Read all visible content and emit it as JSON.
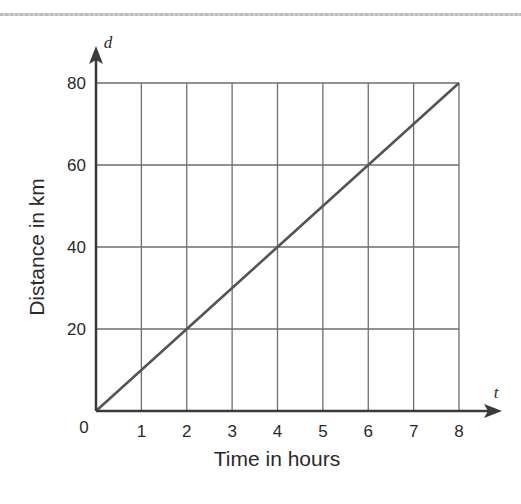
{
  "chart_data": {
    "type": "line",
    "title": "",
    "xlabel": "Time in hours",
    "ylabel": "Distance in km",
    "x_axis_variable": "t",
    "y_axis_variable": "d",
    "origin_label": "0",
    "xlim": [
      0,
      8
    ],
    "ylim": [
      0,
      80
    ],
    "x_ticks": [
      "1",
      "2",
      "3",
      "4",
      "5",
      "6",
      "7",
      "8"
    ],
    "y_ticks": [
      "20",
      "40",
      "60",
      "80"
    ],
    "grid": true,
    "legend": null,
    "series": [
      {
        "name": "distance",
        "x": [
          0,
          1,
          2,
          3,
          4,
          5,
          6,
          7,
          8
        ],
        "values": [
          0,
          10,
          20,
          30,
          40,
          50,
          60,
          70,
          80
        ],
        "color": "#555555"
      }
    ]
  },
  "colors": {
    "axis": "#3a3a3a",
    "grid": "#6e6e6e",
    "line": "#555555",
    "text": "#2a2a2a"
  }
}
